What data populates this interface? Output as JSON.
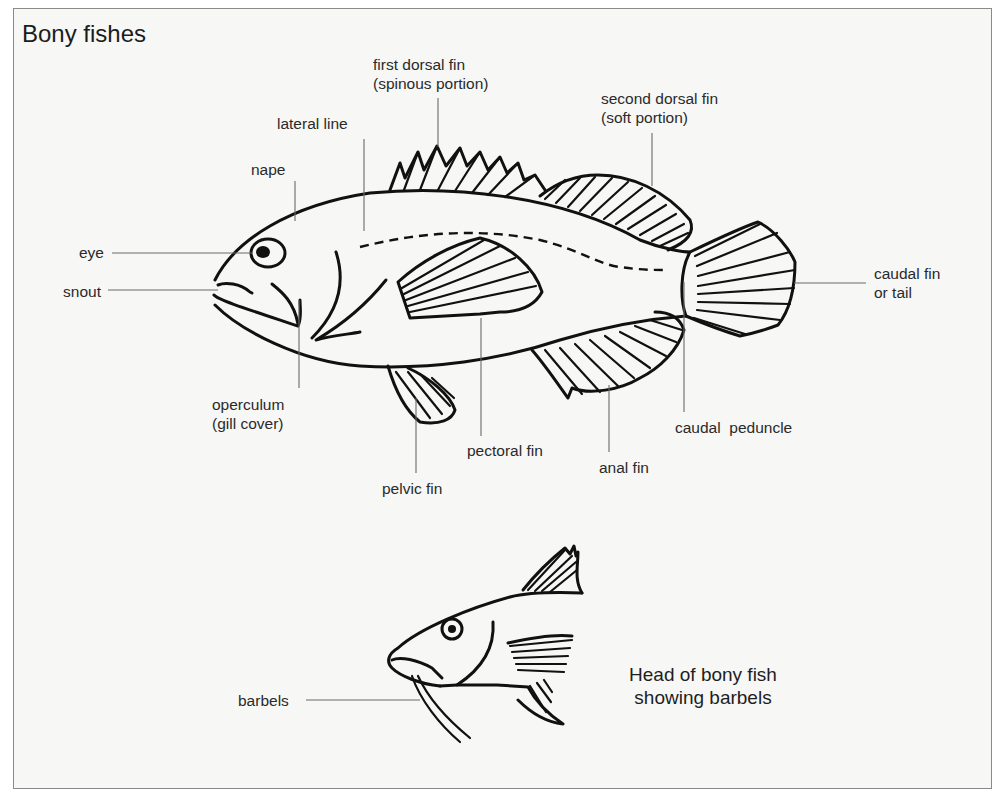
{
  "title": "Bony fishes",
  "colors": {
    "background": "#f7f7f6",
    "frame_border": "#8a8a8a",
    "ink": "#111111",
    "leader_line": "#6b6b6b",
    "text": "#2a2a2a"
  },
  "main_fish": {
    "labels": {
      "first_dorsal_fin": {
        "line1": "first dorsal fin",
        "line2": "(spinous portion)"
      },
      "second_dorsal_fin": {
        "line1": "second dorsal fin",
        "line2": "(soft portion)"
      },
      "lateral_line": "lateral line",
      "nape": "nape",
      "eye": "eye",
      "snout": "snout",
      "caudal_fin": {
        "line1": "caudal fin",
        "line2": "or tail"
      },
      "operculum": {
        "line1": "operculum",
        "line2": "(gill cover)"
      },
      "caudal_peduncle": "caudal  peduncle",
      "pectoral_fin": "pectoral fin",
      "anal_fin": "anal fin",
      "pelvic_fin": "pelvic fin"
    }
  },
  "head_fish": {
    "labels": {
      "barbels": "barbels"
    },
    "caption": {
      "line1": "Head of bony fish",
      "line2": "showing barbels"
    }
  }
}
